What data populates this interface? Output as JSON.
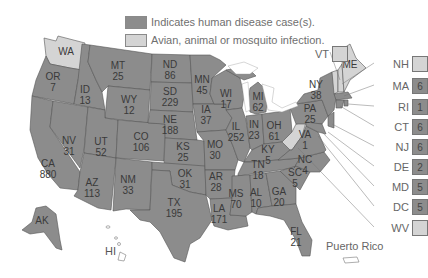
{
  "legend": {
    "human": {
      "label": "Indicates human disease case(s).",
      "color": "#8c8c8c"
    },
    "avian": {
      "label": "Avian, animal or mosquito infection.",
      "color": "#d4d4d4"
    }
  },
  "colors": {
    "human": "#8c8c8c",
    "avian": "#d4d4d4",
    "border": "#555555",
    "background": "#ffffff"
  },
  "states": [
    {
      "abbr": "WA",
      "cases": null,
      "type": "avian"
    },
    {
      "abbr": "OR",
      "cases": "7",
      "type": "human"
    },
    {
      "abbr": "CA",
      "cases": "880",
      "type": "human"
    },
    {
      "abbr": "ID",
      "cases": "13",
      "type": "human"
    },
    {
      "abbr": "NV",
      "cases": "31",
      "type": "human"
    },
    {
      "abbr": "MT",
      "cases": "25",
      "type": "human"
    },
    {
      "abbr": "WY",
      "cases": "12",
      "type": "human"
    },
    {
      "abbr": "UT",
      "cases": "52",
      "type": "human"
    },
    {
      "abbr": "AZ",
      "cases": "113",
      "type": "human"
    },
    {
      "abbr": "CO",
      "cases": "106",
      "type": "human"
    },
    {
      "abbr": "NM",
      "cases": "33",
      "type": "human"
    },
    {
      "abbr": "ND",
      "cases": "86",
      "type": "human"
    },
    {
      "abbr": "SD",
      "cases": "229",
      "type": "human"
    },
    {
      "abbr": "NE",
      "cases": "188",
      "type": "human"
    },
    {
      "abbr": "KS",
      "cases": "25",
      "type": "human"
    },
    {
      "abbr": "OK",
      "cases": "31",
      "type": "human"
    },
    {
      "abbr": "TX",
      "cases": "195",
      "type": "human"
    },
    {
      "abbr": "MN",
      "cases": "45",
      "type": "human"
    },
    {
      "abbr": "IA",
      "cases": "37",
      "type": "human"
    },
    {
      "abbr": "MO",
      "cases": "30",
      "type": "human"
    },
    {
      "abbr": "AR",
      "cases": "28",
      "type": "human"
    },
    {
      "abbr": "LA",
      "cases": "171",
      "type": "human"
    },
    {
      "abbr": "WI",
      "cases": "17",
      "type": "human"
    },
    {
      "abbr": "IL",
      "cases": "252",
      "type": "human"
    },
    {
      "abbr": "MI",
      "cases": "62",
      "type": "human"
    },
    {
      "abbr": "IN",
      "cases": "23",
      "type": "human"
    },
    {
      "abbr": "OH",
      "cases": "61",
      "type": "human"
    },
    {
      "abbr": "KY",
      "cases": "5",
      "type": "human"
    },
    {
      "abbr": "TN",
      "cases": "18",
      "type": "human"
    },
    {
      "abbr": "MS",
      "cases": "70",
      "type": "human"
    },
    {
      "abbr": "AL",
      "cases": "10",
      "type": "human"
    },
    {
      "abbr": "GA",
      "cases": "20",
      "type": "human"
    },
    {
      "abbr": "FL",
      "cases": "21",
      "type": "human"
    },
    {
      "abbr": "SC",
      "cases": "5",
      "type": "human"
    },
    {
      "abbr": "NC",
      "cases": "4",
      "type": "human"
    },
    {
      "abbr": "VA",
      "cases": "1",
      "type": "human"
    },
    {
      "abbr": "PA",
      "cases": "25",
      "type": "human"
    },
    {
      "abbr": "NY",
      "cases": "38",
      "type": "human"
    },
    {
      "abbr": "ME",
      "cases": null,
      "type": "avian"
    },
    {
      "abbr": "AK",
      "cases": null,
      "type": "human"
    },
    {
      "abbr": "HI",
      "cases": null,
      "type": "none"
    }
  ],
  "callouts": [
    {
      "abbr": "VT",
      "cases": null,
      "type": "avian"
    },
    {
      "abbr": "NH",
      "cases": null,
      "type": "avian"
    },
    {
      "abbr": "MA",
      "cases": "6",
      "type": "human"
    },
    {
      "abbr": "RI",
      "cases": "1",
      "type": "human"
    },
    {
      "abbr": "CT",
      "cases": "6",
      "type": "human"
    },
    {
      "abbr": "NJ",
      "cases": "6",
      "type": "human"
    },
    {
      "abbr": "DE",
      "cases": "2",
      "type": "human"
    },
    {
      "abbr": "MD",
      "cases": "5",
      "type": "human"
    },
    {
      "abbr": "DC",
      "cases": "5",
      "type": "human"
    },
    {
      "abbr": "WV",
      "cases": null,
      "type": "avian"
    }
  ],
  "territories": {
    "puerto_rico": {
      "label": "Puerto Rico",
      "type": "none"
    },
    "hawaii_label": "HI"
  }
}
